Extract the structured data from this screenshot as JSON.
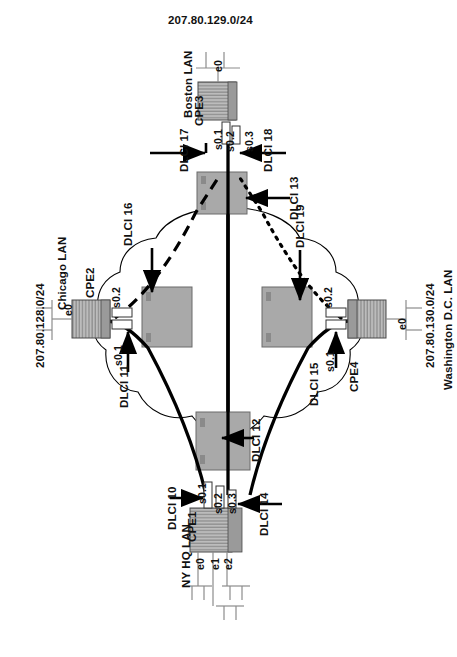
{
  "diagram": {
    "title_top": "207.80.129.0/24",
    "type": "frame-relay-network-topology"
  },
  "sites": {
    "boston": {
      "lan_label": "Boston LAN",
      "subnet": "207.80.129.0/24",
      "router": "CPE3",
      "lan_iface": "e0",
      "serial_ifaces": [
        "s0.1",
        "s0.2",
        "s0.3"
      ]
    },
    "chicago": {
      "lan_label": "Chicago LAN",
      "subnet": "207.80.128.0/24",
      "router": "CPE2",
      "lan_iface": "e0",
      "serial_ifaces": [
        "s0.1",
        "s0.2"
      ]
    },
    "washington": {
      "lan_label": "Washington D.C. LAN",
      "subnet": "207.80.130.0/24",
      "router": "CPE4",
      "lan_iface": "e0",
      "serial_ifaces": [
        "s0.1",
        "s0.2"
      ]
    },
    "ny_hq": {
      "lan_label": "NY HQ LAN",
      "router": "CPE1",
      "lan_ifaces": [
        "e0",
        "e1",
        "e2"
      ],
      "serial_ifaces": [
        "s0.1",
        "s0.2",
        "s0.3"
      ]
    }
  },
  "dlci": {
    "d10": "DLCI 10",
    "d11": "DLCI 11",
    "d12": "DLCI 12",
    "d13": "DLCI 13",
    "d14": "DLCI 14",
    "d15": "DLCI 15",
    "d16": "DLCI 16",
    "d17": "DLCI 17",
    "d18": "DLCI 18",
    "d19": "DLCI 19"
  },
  "colors": {
    "switch_fill": "#a9a9a9",
    "switch_stroke": "#555555",
    "router_fill": "#b4b4b4",
    "router_stroke": "#4a4a4a",
    "line": "#000000",
    "cloud_stroke": "#000000",
    "lan_line": "#8c8c8c"
  }
}
